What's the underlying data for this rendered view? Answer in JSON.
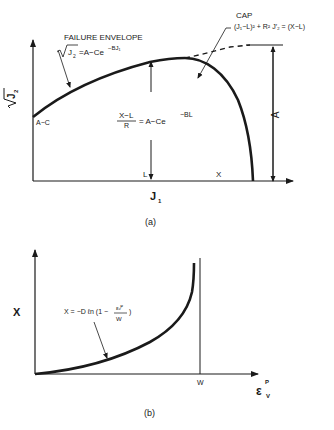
{
  "figure_a": {
    "caption": "(a)",
    "y_axis_label": "√J₂",
    "x_axis_label": "J",
    "x_axis_sub": "1",
    "failure_envelope_label": "FAILURE ENVELOPE",
    "failure_envelope_eq_lhs": "√J₂",
    "failure_envelope_eq_rhs": "=A−Ce",
    "failure_envelope_eq_exp": "−BJ₁",
    "cap_label": "CAP",
    "cap_eq": "(J₁−L)² + R² J′₂ = (X−L)",
    "intercept_label": "A−C",
    "frac_num": "X−L",
    "frac_den": "R",
    "frac_rhs": "= A−Ce",
    "frac_exp": "−BL",
    "L_label": "L",
    "X_label": "X",
    "A_label": "A"
  },
  "figure_b": {
    "caption": "(b)",
    "y_axis_label": "X",
    "x_axis_label": "ε",
    "x_axis_sup": "P",
    "x_axis_sub": "V",
    "w_label": "W",
    "eq": "X = −D ℓn (1 − ",
    "eq_num": "εᵥᴾ",
    "eq_den": "W",
    "eq_close": ")"
  },
  "colors": {
    "ink": "#1a1a1a",
    "background": "#ffffff"
  }
}
